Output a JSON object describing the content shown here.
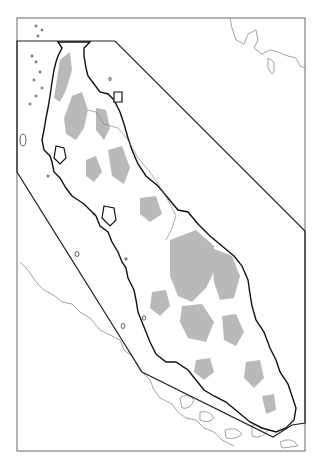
{
  "map": {
    "subject": "Malay Peninsula study area map",
    "frame": {
      "x": 17,
      "y": 18,
      "width": 288,
      "height": 433
    },
    "study_area_polygon": [
      [
        17,
        41
      ],
      [
        115,
        41
      ],
      [
        305,
        231
      ],
      [
        305,
        423
      ],
      [
        292,
        425
      ],
      [
        273,
        437
      ],
      [
        142,
        372
      ],
      [
        17,
        172
      ],
      [
        17,
        41
      ]
    ],
    "colors": {
      "frame": "#555555",
      "boundary": "#222222",
      "coastline": "#111111",
      "outside_coast": "#8a8a8a",
      "highland_fill": "#b9b9b9",
      "land_fill": "#ffffff",
      "background": "#ffffff"
    }
  }
}
